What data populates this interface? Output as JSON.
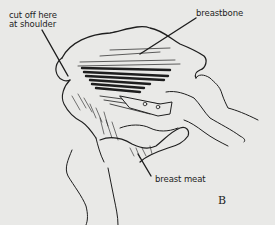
{
  "figure": {
    "letter": "B",
    "labels": {
      "cut": {
        "line1": "cut off here",
        "line2": "at shoulder"
      },
      "breastbone": "breastbone",
      "breast_meat": "breast meat"
    }
  },
  "colors": {
    "background": "#e9e9e7",
    "ink": "#1e1e1e"
  }
}
